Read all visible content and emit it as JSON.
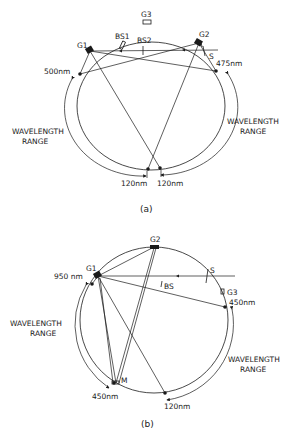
{
  "figure": {
    "panel_a": {
      "caption": "(a)",
      "labels": {
        "g1": "G1",
        "g2": "G2",
        "g3": "G3",
        "bs1": "BS1",
        "bs2": "BS2",
        "s": "S",
        "wl_left_top": "500nm",
        "wl_right_top": "475nm",
        "wl_bottom_left": "120nm",
        "wl_bottom_right": "120nm",
        "range_left_1": "WAVELENGTH",
        "range_left_2": "RANGE",
        "range_right_1": "WAVELENGTH",
        "range_right_2": "RANGE"
      }
    },
    "panel_b": {
      "caption": "(b)",
      "labels": {
        "g1": "G1",
        "g2": "G2",
        "g3": "G3",
        "bs": "BS",
        "s": "S",
        "m": "M",
        "wl_left_top": "950 nm",
        "wl_right_top": "450nm",
        "wl_bottom_left": "450nm",
        "wl_bottom_right": "120nm",
        "range_left_1": "WAVELENGTH",
        "range_left_2": "RANGE",
        "range_right_1": "WAVELENGTH",
        "range_right_2": "RANGE"
      }
    }
  }
}
